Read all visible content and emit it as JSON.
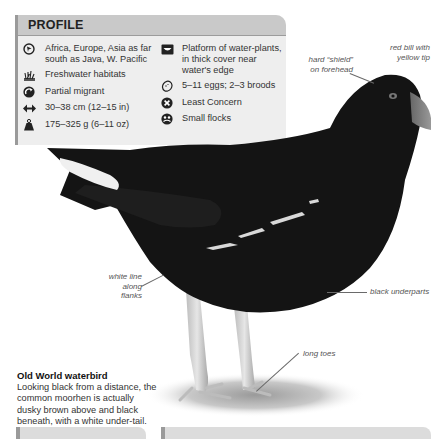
{
  "profile": {
    "title": "PROFILE",
    "left_items": [
      {
        "icon": "globe-range-icon",
        "text": "Africa, Europe, Asia as far south as Java, W. Pacific"
      },
      {
        "icon": "reeds-habitat-icon",
        "text": "Freshwater habitats"
      },
      {
        "icon": "migration-arrow-icon",
        "text": "Partial migrant"
      },
      {
        "icon": "length-arrows-icon",
        "text": "30–38 cm (12–15 in)"
      },
      {
        "icon": "weight-icon",
        "text": "175–325 g (6–11 oz)"
      }
    ],
    "right_items": [
      {
        "icon": "nest-icon",
        "text": "Platform of water-plants, in thick cover near water's edge"
      },
      {
        "icon": "egg-icon",
        "text": "5–11 eggs; 2–3 broods"
      },
      {
        "icon": "conservation-status-icon",
        "text": "Least Concern"
      },
      {
        "icon": "social-group-icon",
        "text": "Small flocks"
      }
    ]
  },
  "annotations": {
    "bill": "red bill with yellow tip",
    "shield": "hard “shield” on forehead",
    "flanks": "white line along flanks",
    "underparts": "black underparts",
    "toes": "long toes"
  },
  "caption": {
    "title": "Old World waterbird",
    "body": "Looking black from a distance, the common moorhen is actually dusky brown above and black beneath, with a white under-tail."
  },
  "colors": {
    "panel_bg": "#eeeeee",
    "panel_header": "#c9c9c9",
    "panel_accent": "#9a9a9a",
    "bird_black": "#141414"
  }
}
